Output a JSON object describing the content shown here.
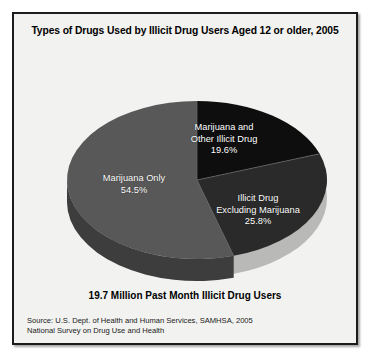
{
  "figure": {
    "title": "Types of Drugs Used by Illicit Drug Users Aged 12 or older, 2005",
    "caption": "19.7 Million Past Month Illicit Drug Users",
    "source_lines": [
      "Source: U.S. Dept. of Health and Human Services, SAMHSA, 2005",
      "National Survey on Drug Use and Health"
    ],
    "background_color": "#f2f2f0",
    "border_color": "#1c1c1c"
  },
  "labels": {
    "marijuana_other": {
      "line1": "Marijuana and",
      "line2": "Other Illicit Drug",
      "value": "19.6%"
    },
    "illicit_excluding": {
      "line1": "Illicit Drug",
      "line2": "Excluding Marijuana",
      "value": "25.8%"
    },
    "marijuana_only": {
      "line1": "Marijuana Only",
      "value": "54.5%"
    }
  },
  "chart_data": {
    "type": "pie",
    "title": "Types of Drugs Used by Illicit Drug Users Aged 12 or older, 2005",
    "subtitle": "19.7 Million Past Month Illicit Drug Users",
    "unit": "percent",
    "three_d": true,
    "legend": "none",
    "labels_inside_slices": true,
    "categories": [
      "Marijuana Only",
      "Marijuana and Other Illicit Drug",
      "Illicit Drug Excluding Marijuana"
    ],
    "values": [
      54.5,
      19.6,
      25.8
    ],
    "colors": [
      "#585858",
      "#0e0e0e",
      "#2a2a2a"
    ],
    "side_colors": [
      "#3d3d3d",
      "#080808",
      "#1b1b1b"
    ],
    "data_labels": [
      "54.5%",
      "19.6%",
      "25.8%"
    ],
    "total": 99.9,
    "source": "Source: U.S. Dept. of Health and Human Services, SAMHSA, 2005 National Survey on Drug Use and Health"
  }
}
